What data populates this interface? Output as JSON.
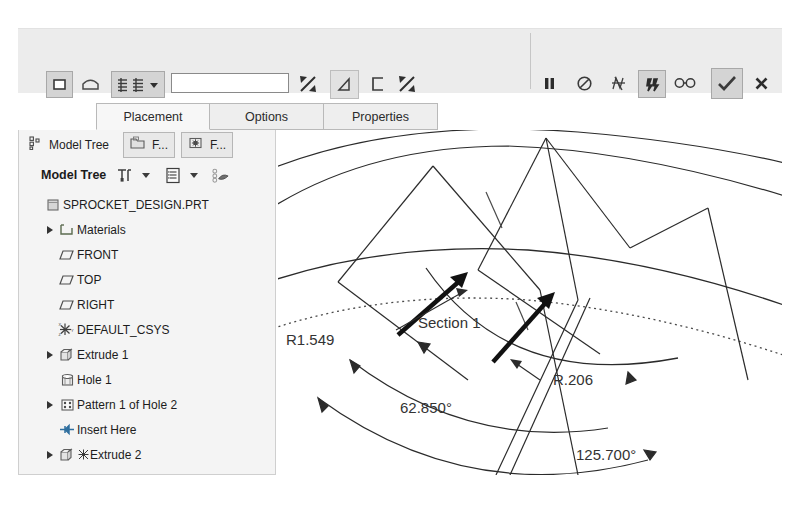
{
  "app": {
    "title": "Creo Parametric - Sprocket Design"
  },
  "dashboard": {
    "left_tools": [
      {
        "name": "extrude-solid-icon",
        "label": "Solid"
      },
      {
        "name": "extrude-surface-icon",
        "label": "Surface"
      },
      {
        "name": "depth-options-icon",
        "label": "Depth Options"
      },
      {
        "name": "depth-dropdown-icon",
        "label": "Depth"
      }
    ],
    "depth_value": "",
    "depth_placeholder": "",
    "flip-depth": "Flip depth direction",
    "right_tools": [
      {
        "name": "pause-icon",
        "label": "Pause"
      },
      {
        "name": "no-preview-icon",
        "label": "No preview"
      },
      {
        "name": "geometry-preview-icon",
        "label": "Preview geometry"
      },
      {
        "name": "feature-preview-icon",
        "label": "Preview feature"
      },
      {
        "name": "glasses-preview-icon",
        "label": "Preview"
      },
      {
        "name": "accept-check-icon",
        "label": "OK"
      },
      {
        "name": "cancel-x-icon",
        "label": "Cancel"
      }
    ]
  },
  "tabs": [
    {
      "label": "Placement",
      "active": true
    },
    {
      "label": "Options",
      "active": false
    },
    {
      "label": "Properties",
      "active": false
    }
  ],
  "navigator": {
    "tab_label": "Model Tree",
    "side_tabs": [
      {
        "label": "F...",
        "name": "folder-browser-tab"
      },
      {
        "label": "F...",
        "name": "favorites-tab"
      }
    ],
    "toolbar_title": "Model Tree",
    "toolbar_buttons": [
      {
        "name": "settings-tools-icon",
        "label": "Settings"
      },
      {
        "name": "settings-dropdown-icon",
        "label": "Settings menu"
      },
      {
        "name": "tree-filters-icon",
        "label": "Filters"
      },
      {
        "name": "filters-dropdown-icon",
        "label": "Filters menu"
      },
      {
        "name": "display-style-icon",
        "label": "Display"
      }
    ],
    "tree": [
      {
        "label": "SPROCKET_DESIGN.PRT",
        "icon": "part-icon",
        "depth": 0,
        "expandable": false
      },
      {
        "label": "Materials",
        "icon": "materials-folder-icon",
        "depth": 1,
        "expandable": true
      },
      {
        "label": "FRONT",
        "icon": "datum-plane-icon",
        "depth": 1,
        "expandable": false
      },
      {
        "label": "TOP",
        "icon": "datum-plane-icon",
        "depth": 1,
        "expandable": false
      },
      {
        "label": "RIGHT",
        "icon": "datum-plane-icon",
        "depth": 1,
        "expandable": false
      },
      {
        "label": "DEFAULT_CSYS",
        "icon": "coordinate-system-icon",
        "depth": 1,
        "expandable": false
      },
      {
        "label": "Extrude 1",
        "icon": "extrude-feature-icon",
        "depth": 1,
        "expandable": true
      },
      {
        "label": "Hole 1",
        "icon": "hole-feature-icon",
        "depth": 1,
        "expandable": false
      },
      {
        "label": "Pattern 1 of Hole 2",
        "icon": "pattern-feature-icon",
        "depth": 1,
        "expandable": true
      },
      {
        "label": "Insert Here",
        "icon": "insert-here-icon",
        "depth": 1,
        "expandable": false
      },
      {
        "label": "Extrude 2",
        "icon": "extrude-feature-icon",
        "depth": 1,
        "expandable": true
      }
    ]
  },
  "viewport": {
    "section_label": "Section 1",
    "dimensions": [
      {
        "name": "radius-dim-large",
        "value": "R1.549"
      },
      {
        "name": "radius-dim-small",
        "value": "R.206"
      },
      {
        "name": "angle-dim-inner",
        "value": "62.850°"
      },
      {
        "name": "angle-dim-outer",
        "value": "125.700°"
      }
    ]
  },
  "colors": {
    "ribbon": "#ececec",
    "panel": "#f4f4f4",
    "tab_active": "#f7f7f7",
    "accent_selected": "#d4d4d4",
    "geometry_line": "#2b2b2b",
    "dim_text": "#333333"
  }
}
